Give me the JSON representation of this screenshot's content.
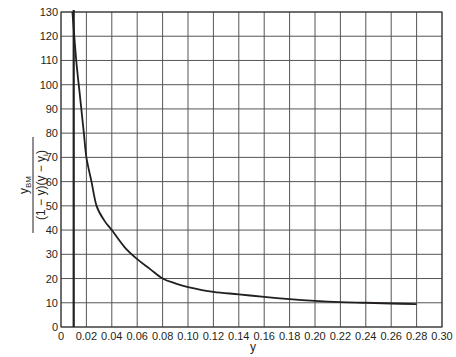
{
  "chart_data": {
    "type": "line",
    "title": "",
    "xlabel": "y",
    "ylabel": {
      "numerator": "y",
      "numerator_sub": "BM",
      "denominator_a": "(1 − y)(y − y",
      "denominator_sub": "i",
      "denominator_b": ")"
    },
    "xlim": [
      0,
      0.3
    ],
    "ylim": [
      0,
      130
    ],
    "grid": true,
    "legend": null,
    "x_ticks": [
      "0",
      "0.02",
      "0.04",
      "0.06",
      "0.08",
      "0.10",
      "0.12",
      "0.14",
      "0.16",
      "0.18",
      "0.20",
      "0.22",
      "0.24",
      "0.26",
      "0.28",
      "0.30"
    ],
    "y_ticks": [
      "0",
      "10",
      "20",
      "30",
      "40",
      "50",
      "60",
      "70",
      "80",
      "90",
      "100",
      "110",
      "120",
      "130"
    ],
    "series": [
      {
        "name": "y_BM / ((1 - y)(y - y_i))",
        "x": [
          0.009,
          0.012,
          0.015,
          0.018,
          0.02,
          0.024,
          0.028,
          0.034,
          0.04,
          0.05,
          0.06,
          0.07,
          0.08,
          0.09,
          0.1,
          0.12,
          0.14,
          0.16,
          0.18,
          0.2,
          0.22,
          0.24,
          0.26,
          0.28
        ],
        "values": [
          130,
          110,
          95,
          80,
          70,
          60,
          50,
          44,
          40,
          33,
          28,
          24,
          20,
          18,
          16.5,
          14.5,
          13.5,
          12.4,
          11.5,
          10.8,
          10.3,
          10.0,
          9.7,
          9.4
        ]
      }
    ],
    "annotations": [
      {
        "type": "vertical-line",
        "x": 0.01,
        "label": ""
      }
    ]
  },
  "style": {
    "line_color": "#231f20",
    "grid_color": "#555555",
    "background": "#ffffff"
  }
}
